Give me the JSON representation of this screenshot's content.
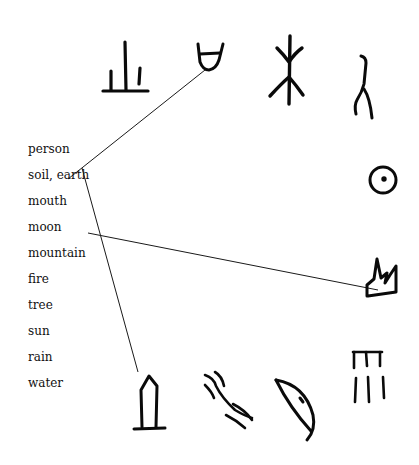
{
  "diagram": {
    "words": [
      {
        "label": "person",
        "y": 146
      },
      {
        "label": "soil, earth",
        "y": 172
      },
      {
        "label": "mouth",
        "y": 198
      },
      {
        "label": "moon",
        "y": 224
      },
      {
        "label": "mountain",
        "y": 250
      },
      {
        "label": "fire",
        "y": 276
      },
      {
        "label": "tree",
        "y": 302
      },
      {
        "label": "sun",
        "y": 328
      },
      {
        "label": "rain",
        "y": 354
      },
      {
        "label": "water",
        "y": 380
      }
    ],
    "glyphs": [
      {
        "name": "soil-earth-glyph",
        "position": "top-1"
      },
      {
        "name": "mouth-glyph",
        "position": "top-2"
      },
      {
        "name": "tree-glyph",
        "position": "top-3"
      },
      {
        "name": "person-glyph",
        "position": "top-4"
      },
      {
        "name": "sun-glyph",
        "position": "right-1"
      },
      {
        "name": "mountain-glyph",
        "position": "right-2"
      },
      {
        "name": "rain-glyph",
        "position": "right-3"
      },
      {
        "name": "moon-glyph",
        "position": "bottom-3"
      },
      {
        "name": "water-glyph",
        "position": "bottom-2"
      },
      {
        "name": "fire-or-house-glyph",
        "position": "bottom-1"
      }
    ],
    "connections": [
      {
        "word": "mouth",
        "glyph": "mouth-glyph"
      },
      {
        "word": "mountain",
        "glyph": "mountain-glyph"
      },
      {
        "word": "soil, earth",
        "glyph": "bottom-1-glyph"
      }
    ]
  }
}
